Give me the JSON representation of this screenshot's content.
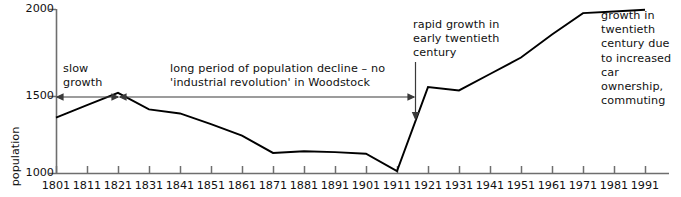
{
  "chart_data": {
    "type": "line",
    "title": "",
    "xlabel": "",
    "ylabel": "population",
    "x": [
      1801,
      1811,
      1821,
      1831,
      1841,
      1851,
      1861,
      1871,
      1881,
      1891,
      1901,
      1911,
      1921,
      1931,
      1941,
      1951,
      1961,
      1971,
      1981,
      1991
    ],
    "values": [
      1340,
      1415,
      1490,
      1390,
      1365,
      1300,
      1230,
      1125,
      1135,
      1130,
      1120,
      1015,
      1525,
      1505,
      1605,
      1705,
      1845,
      1975,
      1985,
      1995
    ],
    "series": [
      {
        "name": "population",
        "values": [
          1340,
          1415,
          1490,
          1390,
          1365,
          1300,
          1230,
          1125,
          1135,
          1130,
          1120,
          1015,
          1525,
          1505,
          1605,
          1705,
          1845,
          1975,
          1985,
          1995
        ]
      }
    ],
    "categories": [
      "1801",
      "1811",
      "1821",
      "1831",
      "1841",
      "1851",
      "1861",
      "1871",
      "1881",
      "1891",
      "1901",
      "1911",
      "1921",
      "1931",
      "1941",
      "1951",
      "1961",
      "1971",
      "1981",
      "1991"
    ],
    "xlim": [
      1801,
      1991
    ],
    "ylim": [
      1000,
      2000
    ],
    "ytick_values": [
      1000,
      1500,
      2000
    ],
    "ytick_labels": [
      "1000",
      "1500",
      "2000"
    ],
    "grid": false,
    "legend": false,
    "line_color": "#000000",
    "axis_color": "#6e6e6e"
  },
  "axes": {
    "y_label": "population",
    "y_ticks": [
      "2000",
      "1500",
      "1000"
    ],
    "x_ticks": [
      "1801",
      "1811",
      "1821",
      "1831",
      "1841",
      "1851",
      "1861",
      "1871",
      "1881",
      "1891",
      "1901",
      "1911",
      "1921",
      "1931",
      "1941",
      "1951",
      "1961",
      "1971",
      "1981",
      "1991"
    ]
  },
  "annotations": {
    "slow_growth": "slow\ngrowth",
    "decline": "long period of population decline – no\n'industrial revolution' in Woodstock",
    "rapid_growth": "rapid growth in\nearly twentieth\ncentury",
    "car_ownership": "growth in\ntwentieth\ncentury due\nto increased\ncar ownership,\ncommuting"
  }
}
